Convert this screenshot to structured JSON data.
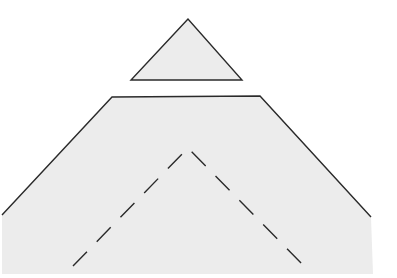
{
  "diagram": {
    "title": "",
    "colors": {
      "fill": "#ececec",
      "stroke": "#2a2a2a",
      "background": "#ffffff"
    },
    "shapes": [
      {
        "name": "small-triangle",
        "type": "polygon",
        "points": "188,19 131,80 242,80",
        "outline": true
      },
      {
        "name": "large-trapezoid-body",
        "type": "polygon",
        "points": "112,97 260,96 371,217 373,274 2,274 2,215",
        "outline_path": "M2,215 L112,97 L260,96 L371,217"
      },
      {
        "name": "dashed-fold-line",
        "type": "polyline",
        "points": "73,266 188,148 308,270",
        "dashed": true
      }
    ]
  }
}
